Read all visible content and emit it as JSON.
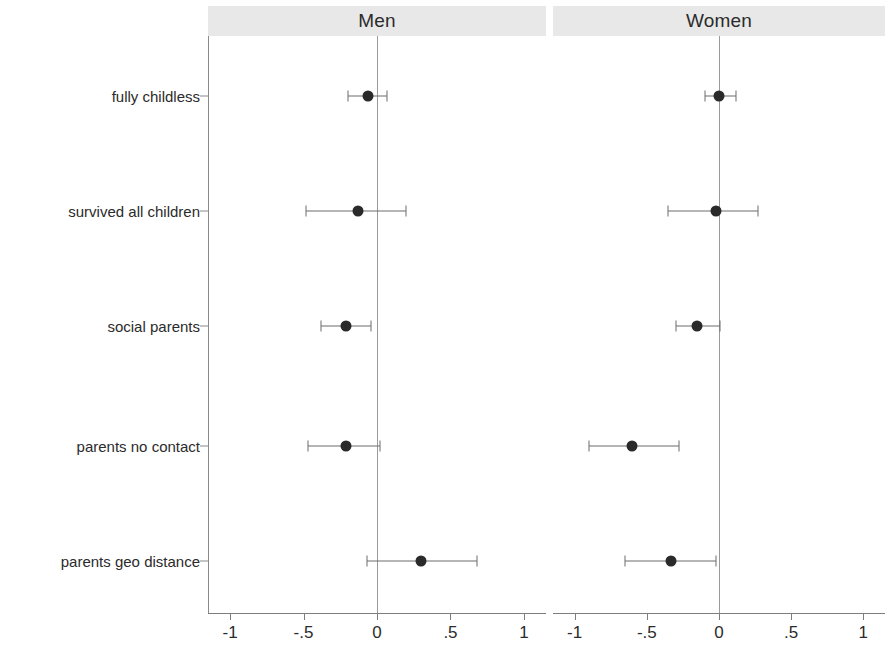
{
  "chart_data": {
    "type": "scatter",
    "title": "",
    "subtitle": "",
    "xlabel": "",
    "ylabel": "",
    "xlim": [
      -1.15,
      1.15
    ],
    "xticks": [
      -1,
      -0.5,
      0,
      0.5,
      1
    ],
    "xticklabels": [
      "-1",
      "-.5",
      "0",
      ".5",
      "1"
    ],
    "grid": false,
    "legend": "none",
    "zero_reference_line": 0,
    "panels": [
      {
        "label": "Men",
        "categories": [
          "fully childless",
          "survived all children",
          "social parents",
          "parents no contact",
          "parents geo distance"
        ],
        "estimates": [
          -0.06,
          -0.13,
          -0.21,
          -0.21,
          0.3
        ],
        "ci_low": [
          -0.2,
          -0.48,
          -0.38,
          -0.47,
          -0.07
        ],
        "ci_high": [
          0.07,
          0.2,
          -0.04,
          0.02,
          0.68
        ]
      },
      {
        "label": "Women",
        "categories": [
          "fully childless",
          "survived all children",
          "social parents",
          "parents no contact",
          "parents geo distance"
        ],
        "estimates": [
          0.0,
          -0.02,
          -0.15,
          -0.6,
          -0.33
        ],
        "ci_low": [
          -0.1,
          -0.35,
          -0.3,
          -0.9,
          -0.65
        ],
        "ci_high": [
          0.12,
          0.27,
          0.01,
          -0.28,
          -0.02
        ]
      }
    ],
    "y_categories": [
      "fully childless",
      "survived all children",
      "social parents",
      "parents no contact",
      "parents geo distance"
    ],
    "marker": "filled-circle",
    "marker_color": "#2a2a2a",
    "line_color": "#6d6d6d",
    "panel_strip_color": "#e8e8e8"
  }
}
